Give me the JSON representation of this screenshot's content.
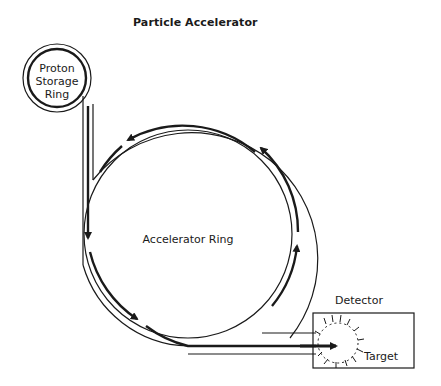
{
  "title": "Particle Accelerator",
  "labels": {
    "storage_ring": [
      "Proton",
      "Storage",
      "Ring"
    ],
    "accelerator_ring": "Accelerator Ring",
    "detector": "Detector",
    "target": "Target"
  },
  "colors": {
    "line": "#1a1a1a",
    "background": "#ffffff"
  }
}
